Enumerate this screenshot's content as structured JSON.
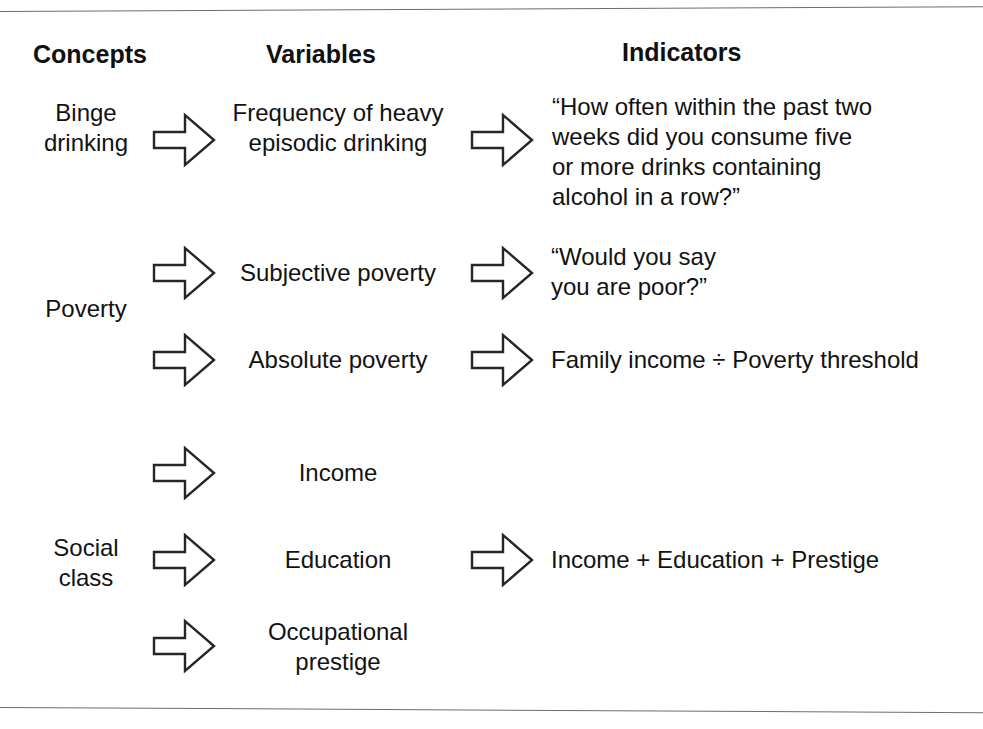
{
  "figure": {
    "background_color": "#ffffff",
    "ink_color": "#121212",
    "arrow_outline_color": "#262626",
    "rule_color": "#6d6d6d"
  },
  "headers": {
    "concepts": "Concepts",
    "variables": "Variables",
    "indicators": "Indicators"
  },
  "rows": [
    {
      "concept": "Binge\ndrinking",
      "variable": "Frequency of heavy\nepisodic drinking",
      "indicator": "“How often within the past two\nweeks did you consume five\nor more drinks containing\nalcohol in a row?”"
    },
    {
      "concept": "Poverty",
      "variable": "Subjective poverty",
      "indicator": "“Would you say\nyou are poor?”"
    },
    {
      "concept": "",
      "variable": "Absolute poverty",
      "indicator": "Family income ÷ Poverty threshold"
    },
    {
      "concept": "",
      "variable": "Income",
      "indicator": ""
    },
    {
      "concept": "Social\nclass",
      "variable": "Education",
      "indicator": "Income + Education + Prestige"
    },
    {
      "concept": "",
      "variable": "Occupational\nprestige",
      "indicator": ""
    }
  ],
  "arrows": {
    "icon": "block-arrow-right-icon",
    "count": 10,
    "description": "hollow right-pointing block arrows linking concepts to variables and variables to indicators"
  }
}
